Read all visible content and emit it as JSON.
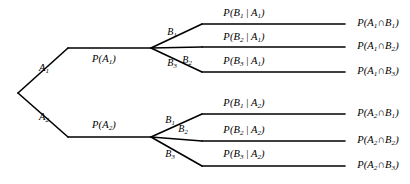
{
  "diagram": {
    "type": "probability-tree",
    "background_color": "#ffffff",
    "line_color": "#000000",
    "root": {
      "x": 18,
      "y": 93
    },
    "stage1": [
      {
        "id": "A1",
        "label_html": "A<sub>1</sub>",
        "prob_html": "P(A<sub>1</sub>)",
        "label_x": 44,
        "label_y": 69,
        "prob_x": 104,
        "prob_y": 60,
        "bend_x": 68,
        "bend_y": 48,
        "node_x": 151,
        "node_y": 48
      },
      {
        "id": "A2",
        "label_html": "A<sub>2</sub>",
        "prob_html": "P(A<sub>2</sub>)",
        "label_x": 44,
        "label_y": 118,
        "prob_x": 104,
        "prob_y": 126,
        "bend_x": 68,
        "bend_y": 137,
        "node_x": 151,
        "node_y": 137
      }
    ],
    "stage2_groups": [
      {
        "parent": "A1",
        "branches": [
          {
            "id": "A1B1",
            "branch_label_html": "B<sub>1</sub>",
            "branch_label_x": 172,
            "branch_label_y": 33,
            "cond_html": "P(B<sub>1</sub>&#8201;|&#8201;A<sub>1</sub>)",
            "cond_x": 244,
            "cond_y": 14,
            "joint_html": "P(A<sub>1</sub>&#8745;B<sub>1</sub>)",
            "joint_x": 378,
            "joint_y": 24,
            "bend_x": 202,
            "bend_y": 24,
            "end_x": 345,
            "end_y": 24
          },
          {
            "id": "A1B2",
            "branch_label_html": "B<sub>2</sub>",
            "branch_label_x": 187,
            "branch_label_y": 61,
            "cond_html": "P(B<sub>2</sub>&#8201;|&#8201;A<sub>1</sub>)",
            "cond_x": 244,
            "cond_y": 38,
            "joint_html": "P(A<sub>1</sub>&#8745;B<sub>2</sub>)",
            "joint_x": 378,
            "joint_y": 47,
            "bend_x": 202,
            "bend_y": 47,
            "end_x": 345,
            "end_y": 47
          },
          {
            "id": "A1B3",
            "branch_label_html": "B<sub>3</sub>",
            "branch_label_x": 172,
            "branch_label_y": 64,
            "cond_html": "P(B<sub>3</sub>&#8201;|&#8201;A<sub>1</sub>)",
            "cond_x": 244,
            "cond_y": 62,
            "joint_html": "P(A<sub>1</sub>&#8745;B<sub>3</sub>)",
            "joint_x": 378,
            "joint_y": 72,
            "bend_x": 202,
            "bend_y": 72,
            "end_x": 345,
            "end_y": 72
          }
        ]
      },
      {
        "parent": "A2",
        "branches": [
          {
            "id": "A2B1",
            "branch_label_html": "B<sub>1</sub>",
            "branch_label_x": 170,
            "branch_label_y": 121,
            "cond_html": "P(B<sub>1</sub>&#8201;|&#8201;A<sub>2</sub>)",
            "cond_x": 244,
            "cond_y": 104,
            "joint_html": "P(A<sub>2</sub>&#8745;B<sub>1</sub>)",
            "joint_x": 378,
            "joint_y": 114,
            "bend_x": 202,
            "bend_y": 114,
            "end_x": 345,
            "end_y": 114
          },
          {
            "id": "A2B2",
            "branch_label_html": "B<sub>2</sub>",
            "branch_label_x": 183,
            "branch_label_y": 130,
            "cond_html": "P(B<sub>2</sub>&#8201;|&#8201;A<sub>2</sub>)",
            "cond_x": 244,
            "cond_y": 131,
            "joint_html": "P(A<sub>2</sub>&#8745;B<sub>2</sub>)",
            "joint_x": 378,
            "joint_y": 141,
            "bend_x": 202,
            "bend_y": 141,
            "end_x": 345,
            "end_y": 141
          },
          {
            "id": "A2B3",
            "branch_label_html": "B<sub>3</sub>",
            "branch_label_x": 170,
            "branch_label_y": 155,
            "cond_html": "P(B<sub>3</sub>&#8201;|&#8201;A<sub>2</sub>)",
            "cond_x": 244,
            "cond_y": 155,
            "joint_html": "P(A<sub>2</sub>&#8745;B<sub>3</sub>)",
            "joint_x": 378,
            "joint_y": 166,
            "bend_x": 202,
            "bend_y": 166,
            "end_x": 345,
            "end_y": 166
          }
        ]
      }
    ]
  }
}
